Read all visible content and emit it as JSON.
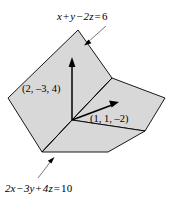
{
  "figure": {
    "background_color": "#ffffff",
    "plane_fill_color": "#d8d8d8",
    "plane_stroke_color": "#000000",
    "vector_color": "#000000",
    "leader_line_color": "#555555",
    "planes": [
      {
        "name": "plane-top",
        "equation_parts": {
          "x_term": "x",
          "plus": "+",
          "y_term": "y",
          "minus": "−",
          "z_term": "2z",
          "equals": "=",
          "constant": "6"
        },
        "equation": "x + y − 2z = 6"
      },
      {
        "name": "plane-bottom",
        "equation_parts": {
          "x_term": "2x",
          "minus1": "−",
          "y_term": "3y",
          "plus": "+",
          "z_term": "4z",
          "equals": "=",
          "constant": "10"
        },
        "equation": "2x − 3y + 4z = 10"
      }
    ],
    "vectors": [
      {
        "name": "vector-left",
        "label": "(2, –3, 4)",
        "components": [
          2,
          -3,
          4
        ],
        "direction": "up"
      },
      {
        "name": "vector-right",
        "label": "(1, 1, –2)",
        "components": [
          1,
          1,
          -2
        ],
        "direction": "right"
      }
    ]
  }
}
